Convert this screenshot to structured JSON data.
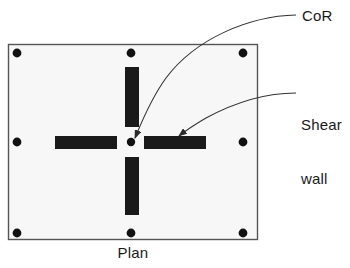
{
  "figure": {
    "caption": "Plan",
    "type": "structural-floor-plan-diagram"
  },
  "labels": {
    "cor": "CoR",
    "shear_wall_line1": "Shear",
    "shear_wall_line2": "wall"
  },
  "colors": {
    "wall_fill": "#1a1a1a",
    "slab_fill": "#f7f7f7",
    "outline": "#555555",
    "column_dot": "#111111",
    "leader_line": "#333333",
    "text": "#1a1a1a"
  },
  "diagram": {
    "slab": {
      "x": 8,
      "y": 44,
      "width": 250,
      "height": 196
    },
    "center_of_rigidity": {
      "x": 131,
      "y": 142,
      "radius": 4
    },
    "columns": [
      {
        "x": 17,
        "y": 53
      },
      {
        "x": 131,
        "y": 53
      },
      {
        "x": 243,
        "y": 53
      },
      {
        "x": 17,
        "y": 142
      },
      {
        "x": 243,
        "y": 142
      },
      {
        "x": 17,
        "y": 233
      },
      {
        "x": 131,
        "y": 233
      },
      {
        "x": 243,
        "y": 233
      }
    ],
    "shear_walls": [
      {
        "name": "wall-north",
        "x": 125,
        "y": 67,
        "width": 14,
        "height": 60,
        "orientation": "vertical"
      },
      {
        "name": "wall-south",
        "x": 125,
        "y": 157,
        "width": 14,
        "height": 58,
        "orientation": "vertical"
      },
      {
        "name": "wall-west",
        "x": 55,
        "y": 136,
        "width": 62,
        "height": 13,
        "orientation": "horizontal"
      },
      {
        "name": "wall-east",
        "x": 144,
        "y": 136,
        "width": 62,
        "height": 13,
        "orientation": "horizontal"
      }
    ],
    "leaders": [
      {
        "name": "leader-cor",
        "path": "M 296 15 C 250 16, 196 38, 166 78 C 150 100, 140 126, 134 138",
        "arrow_tip": {
          "x": 132,
          "y": 141
        },
        "arrow_angle": 108
      },
      {
        "name": "leader-shear-wall",
        "path": "M 296 93 C 262 93, 232 104, 206 118 C 194 125, 184 132, 178 136",
        "arrow_tip": {
          "x": 175,
          "y": 138
        },
        "arrow_angle": 148
      }
    ]
  }
}
